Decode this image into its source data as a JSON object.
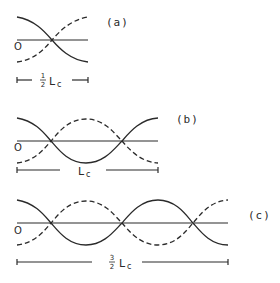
{
  "figure": {
    "panels": [
      {
        "id": "a",
        "label": "(a)",
        "origin_label": "O",
        "scale_bar": {
          "coefficient_num": "1",
          "coefficient_den": "2",
          "symbol": "L",
          "subscript": "c"
        },
        "half_periods": 1
      },
      {
        "id": "b",
        "label": "(b)",
        "origin_label": "O",
        "scale_bar": {
          "coefficient_num": "",
          "coefficient_den": "",
          "symbol": "L",
          "subscript": "c"
        },
        "half_periods": 2
      },
      {
        "id": "c",
        "label": "(c)",
        "origin_label": "O",
        "scale_bar": {
          "coefficient_num": "3",
          "coefficient_den": "2",
          "symbol": "L",
          "subscript": "c"
        },
        "half_periods": 3
      }
    ],
    "legend": {
      "solid": "mode amplitude (solid)",
      "dashed": "coupled mode amplitude (dashed)"
    },
    "colors": {
      "ink": "#2a2a2a",
      "background": "#ffffff"
    }
  }
}
